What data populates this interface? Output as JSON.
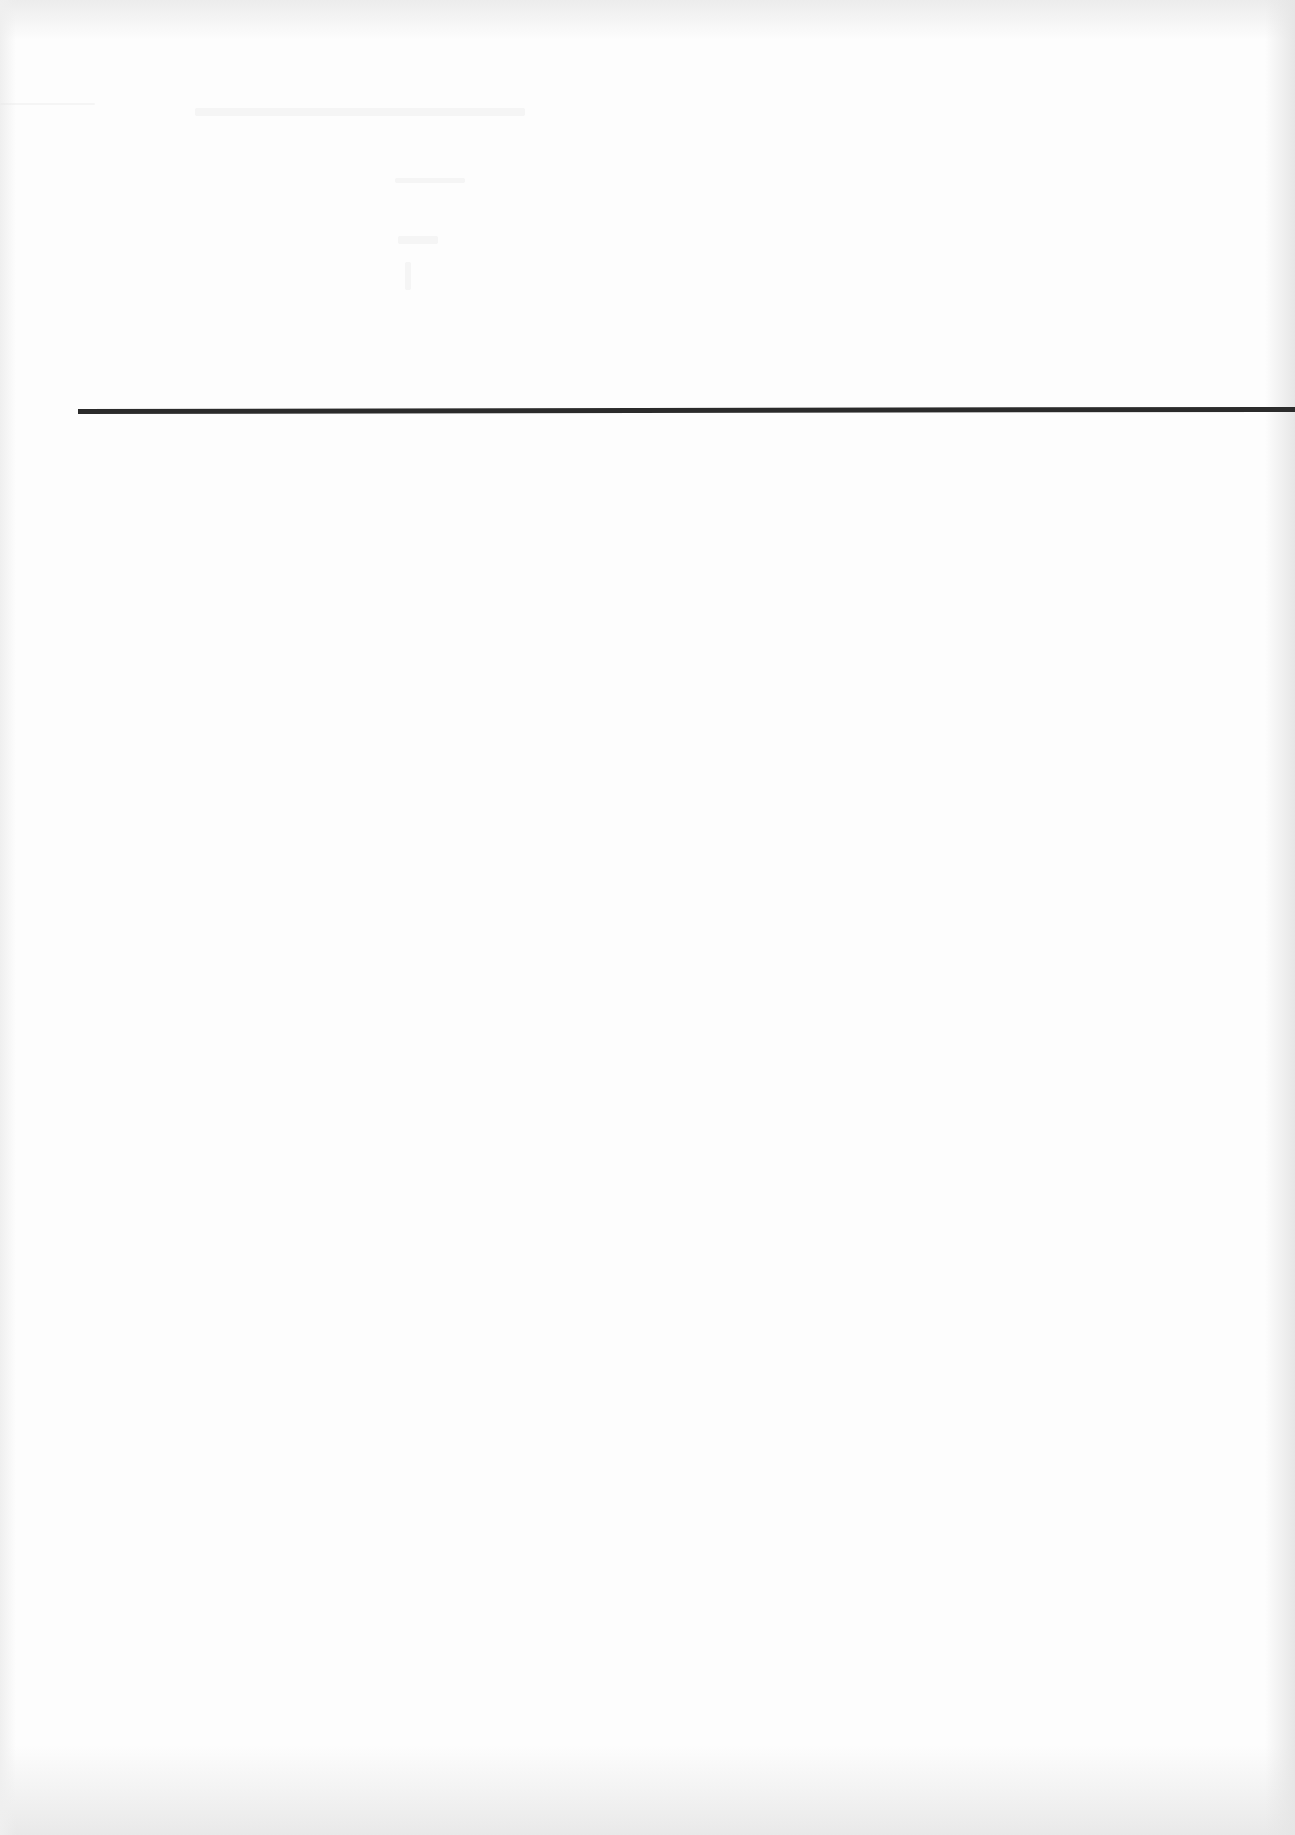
{
  "document": {
    "type": "scanned-page",
    "background_color": "#fdfdfd",
    "rule": {
      "color": "#2b2b2b",
      "x_start": 78,
      "x_end": 1295,
      "y": 412,
      "thickness": 5
    },
    "text_content": []
  }
}
